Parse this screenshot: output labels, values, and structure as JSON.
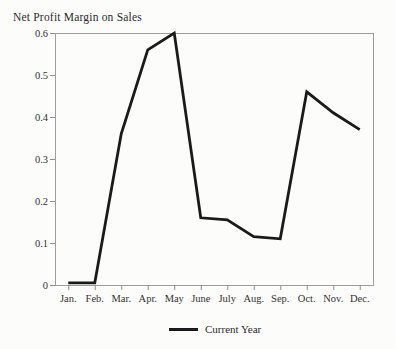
{
  "chart_data": {
    "type": "line",
    "title": "Net Profit Margin on Sales",
    "x_categories": [
      "Jan.",
      "Feb.",
      "Mar.",
      "Apr.",
      "May",
      "June",
      "July",
      "Aug.",
      "Sep.",
      "Oct.",
      "Nov.",
      "Dec."
    ],
    "series": [
      {
        "name": "Current Year",
        "values": [
          0.005,
          0.005,
          0.36,
          0.56,
          0.6,
          0.16,
          0.155,
          0.115,
          0.11,
          0.46,
          0.41,
          0.37
        ]
      }
    ],
    "ylim": [
      0,
      0.6
    ],
    "yticks": [
      0,
      0.1,
      0.2,
      0.3,
      0.4,
      0.5,
      0.6
    ],
    "ytick_labels": [
      "0",
      "0.1",
      "0.2",
      "0.3",
      "0.4",
      "0.5",
      "0.6"
    ],
    "xlabel": "",
    "ylabel": "",
    "grid": false,
    "legend_position": "bottom-center",
    "colors": {
      "line": "#1a1a1a",
      "frame": "#9e9e9e",
      "tick": "#8f8f8f",
      "text": "#333333",
      "background": "#fcfcfa"
    }
  },
  "legend": {
    "label": "Current Year"
  }
}
